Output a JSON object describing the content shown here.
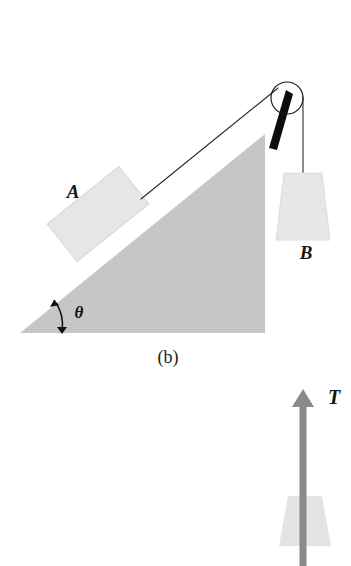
{
  "figure": {
    "caption": "(b)",
    "background_color": "#ffffff"
  },
  "panel_b": {
    "incline": {
      "name": "inclined-plane-wedge",
      "fill_color": "#c6c6c6",
      "angle_symbol": "θ",
      "base_left_x": 20,
      "base_right_x": 265,
      "base_y": 333,
      "apex_x": 265,
      "apex_y": 134
    },
    "block_a": {
      "label": "A",
      "fill_color": "#e6e6e6",
      "stroke_color": "#d2d2d2"
    },
    "block_b": {
      "label": "B",
      "fill_color": "#e6e6e6",
      "stroke_color": "#dcdcdc"
    },
    "pulley": {
      "name": "pulley-wheel",
      "stroke_color": "#1a1a1a",
      "center_x": 287,
      "center_y": 98,
      "radius": 16,
      "bracket_color": "#0d0d0d"
    },
    "rope": {
      "name": "connecting-rope",
      "stroke_color": "#2b2b2b"
    }
  },
  "panel_c": {
    "tension": {
      "label": "T",
      "arrow_color": "#8a8a8a",
      "direction": "up"
    },
    "block": {
      "fill_color": "#e4e4e4",
      "shape": "trapezoid"
    }
  },
  "colors": {
    "wedge_gray": "#c6c6c6",
    "block_gray": "#e6e6e6",
    "arrow_gray": "#8a8a8a",
    "ink_black": "#161616",
    "paper_white": "#ffffff"
  }
}
